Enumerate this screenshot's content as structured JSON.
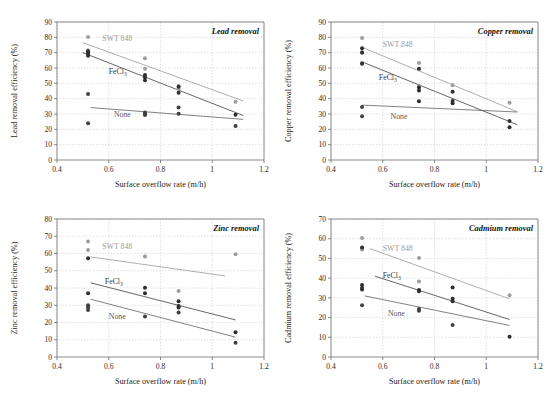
{
  "figure": {
    "shared": {
      "xlabel": "Surface overflow rate (m/h)",
      "xticks": [
        "0.4",
        "0.6",
        "0.8",
        "1",
        "1.2"
      ],
      "xlim": [
        0.4,
        1.2
      ],
      "series_labels": {
        "swt": "SWT 848",
        "fecl3_text": "FeCl",
        "fecl3_sub": "3",
        "none": "None"
      },
      "colors": {
        "swt": "#9d9d9d",
        "fecl3": "#2e2e2e",
        "none": "#3f3f3f",
        "grid": "#c9c9c9",
        "axis": "#6e6e6e"
      }
    },
    "panels": [
      {
        "id": "lead",
        "title": "Lead removal",
        "ylabel": "Lead  removal efficiency (%)",
        "ylim": [
          0,
          90
        ],
        "yticks": [
          "0",
          "10",
          "20",
          "30",
          "40",
          "50",
          "60",
          "70",
          "80",
          "90"
        ],
        "chart_data": {
          "type": "scatter",
          "title": "Lead removal",
          "xlabel": "Surface overflow rate (m/h)",
          "ylabel": "Lead  removal efficiency (%)",
          "xlim": [
            0.4,
            1.2
          ],
          "ylim": [
            0,
            90
          ],
          "grid": true,
          "legend": "inline-labels",
          "series": [
            {
              "name": "SWT 848",
              "color": "#9d9d9d",
              "points": [
                {
                  "x": 0.52,
                  "y": 80.2
                },
                {
                  "x": 0.52,
                  "y": 71.5
                },
                {
                  "x": 0.52,
                  "y": 70.0
                },
                {
                  "x": 0.74,
                  "y": 66.3
                },
                {
                  "x": 0.74,
                  "y": 59.5
                },
                {
                  "x": 0.87,
                  "y": 48.2
                },
                {
                  "x": 0.87,
                  "y": 46.5
                },
                {
                  "x": 1.09,
                  "y": 38.0
                }
              ],
              "fit": [
                {
                  "x": 0.5,
                  "y": 76.5
                },
                {
                  "x": 1.12,
                  "y": 38.5
                }
              ]
            },
            {
              "name": "FeCl3",
              "color": "#2e2e2e",
              "points": [
                {
                  "x": 0.52,
                  "y": 71.0
                },
                {
                  "x": 0.52,
                  "y": 69.5
                },
                {
                  "x": 0.52,
                  "y": 68.0
                },
                {
                  "x": 0.74,
                  "y": 55.5
                },
                {
                  "x": 0.74,
                  "y": 54.0
                },
                {
                  "x": 0.74,
                  "y": 52.0
                },
                {
                  "x": 0.87,
                  "y": 47.8
                },
                {
                  "x": 0.87,
                  "y": 43.8
                },
                {
                  "x": 1.09,
                  "y": 29.5
                }
              ],
              "fit": [
                {
                  "x": 0.5,
                  "y": 70.0
                },
                {
                  "x": 1.12,
                  "y": 29.0
                }
              ]
            },
            {
              "name": "None",
              "color": "#3f3f3f",
              "points": [
                {
                  "x": 0.52,
                  "y": 43.0
                },
                {
                  "x": 0.52,
                  "y": 24.0
                },
                {
                  "x": 0.74,
                  "y": 31.0
                },
                {
                  "x": 0.74,
                  "y": 30.0
                },
                {
                  "x": 0.74,
                  "y": 29.3
                },
                {
                  "x": 0.87,
                  "y": 34.2
                },
                {
                  "x": 0.87,
                  "y": 30.2
                },
                {
                  "x": 1.09,
                  "y": 22.2
                }
              ],
              "fit": [
                {
                  "x": 0.53,
                  "y": 34.2
                },
                {
                  "x": 1.12,
                  "y": 26.5
                }
              ]
            }
          ]
        }
      },
      {
        "id": "copper",
        "title": "Copper removal",
        "ylabel": "Copper removal efficiency (%)",
        "ylim": [
          0,
          90
        ],
        "yticks": [
          "0",
          "10",
          "20",
          "30",
          "40",
          "50",
          "60",
          "70",
          "80",
          "90"
        ],
        "chart_data": {
          "type": "scatter",
          "title": "Copper removal",
          "xlabel": "Surface overflow rate (m/h)",
          "ylabel": "Copper removal efficiency (%)",
          "xlim": [
            0.4,
            1.2
          ],
          "ylim": [
            0,
            90
          ],
          "grid": true,
          "legend": "inline-labels",
          "series": [
            {
              "name": "SWT 848",
              "color": "#9d9d9d",
              "points": [
                {
                  "x": 0.52,
                  "y": 79.5
                },
                {
                  "x": 0.52,
                  "y": 70.5
                },
                {
                  "x": 0.52,
                  "y": 63.5
                },
                {
                  "x": 0.74,
                  "y": 63.3
                },
                {
                  "x": 0.74,
                  "y": 48.5
                },
                {
                  "x": 0.87,
                  "y": 48.8
                },
                {
                  "x": 1.09,
                  "y": 37.3
                }
              ],
              "fit": [
                {
                  "x": 0.52,
                  "y": 73.5
                },
                {
                  "x": 1.12,
                  "y": 31.5
                }
              ]
            },
            {
              "name": "FeCl3",
              "color": "#2e2e2e",
              "points": [
                {
                  "x": 0.52,
                  "y": 72.8
                },
                {
                  "x": 0.52,
                  "y": 70.0
                },
                {
                  "x": 0.52,
                  "y": 62.8
                },
                {
                  "x": 0.74,
                  "y": 59.5
                },
                {
                  "x": 0.74,
                  "y": 47.3
                },
                {
                  "x": 0.74,
                  "y": 45.3
                },
                {
                  "x": 0.74,
                  "y": 38.3
                },
                {
                  "x": 0.87,
                  "y": 44.5
                },
                {
                  "x": 0.87,
                  "y": 38.5
                },
                {
                  "x": 0.87,
                  "y": 37.0
                },
                {
                  "x": 1.09,
                  "y": 25.5
                },
                {
                  "x": 1.09,
                  "y": 21.3
                }
              ],
              "fit": [
                {
                  "x": 0.52,
                  "y": 64.0
                },
                {
                  "x": 1.12,
                  "y": 23.0
                }
              ]
            },
            {
              "name": "None",
              "color": "#3f3f3f",
              "points": [
                {
                  "x": 0.52,
                  "y": 34.5
                },
                {
                  "x": 0.52,
                  "y": 28.5
                }
              ],
              "fit": [
                {
                  "x": 0.52,
                  "y": 35.8
                },
                {
                  "x": 1.12,
                  "y": 31.3
                }
              ]
            }
          ]
        }
      },
      {
        "id": "zinc",
        "title": "Zinc removal",
        "ylabel": "Zinc removal efficiency (%)",
        "ylim": [
          0,
          80
        ],
        "yticks": [
          "0",
          "10",
          "20",
          "30",
          "40",
          "50",
          "60",
          "70",
          "80"
        ],
        "chart_data": {
          "type": "scatter",
          "title": "Zinc removal",
          "xlabel": "Surface overflow rate (m/h)",
          "ylabel": "Zinc removal efficiency (%)",
          "xlim": [
            0.4,
            1.2
          ],
          "ylim": [
            0,
            80
          ],
          "grid": true,
          "legend": "inline-labels",
          "series": [
            {
              "name": "SWT 848",
              "color": "#9d9d9d",
              "points": [
                {
                  "x": 0.52,
                  "y": 67.0
                },
                {
                  "x": 0.52,
                  "y": 62.0
                },
                {
                  "x": 0.74,
                  "y": 58.2
                },
                {
                  "x": 0.87,
                  "y": 38.3
                },
                {
                  "x": 1.09,
                  "y": 59.5
                }
              ],
              "fit": [
                {
                  "x": 0.53,
                  "y": 58.0
                },
                {
                  "x": 1.05,
                  "y": 47.0
                }
              ]
            },
            {
              "name": "FeCl3",
              "color": "#2e2e2e",
              "points": [
                {
                  "x": 0.52,
                  "y": 57.3
                },
                {
                  "x": 0.52,
                  "y": 37.0
                },
                {
                  "x": 0.74,
                  "y": 40.2
                },
                {
                  "x": 0.74,
                  "y": 37.0
                },
                {
                  "x": 0.87,
                  "y": 32.3
                },
                {
                  "x": 0.87,
                  "y": 29.5
                },
                {
                  "x": 0.87,
                  "y": 28.7
                },
                {
                  "x": 1.09,
                  "y": 14.3
                }
              ],
              "fit": [
                {
                  "x": 0.53,
                  "y": 43.0
                },
                {
                  "x": 1.09,
                  "y": 21.5
                }
              ]
            },
            {
              "name": "None",
              "color": "#3f3f3f",
              "points": [
                {
                  "x": 0.52,
                  "y": 30.0
                },
                {
                  "x": 0.52,
                  "y": 28.8
                },
                {
                  "x": 0.52,
                  "y": 27.3
                },
                {
                  "x": 0.74,
                  "y": 23.5
                },
                {
                  "x": 0.87,
                  "y": 25.8
                },
                {
                  "x": 1.09,
                  "y": 8.2
                }
              ],
              "fit": [
                {
                  "x": 0.53,
                  "y": 33.5
                },
                {
                  "x": 1.09,
                  "y": 11.5
                }
              ]
            }
          ]
        }
      },
      {
        "id": "cadmium",
        "title": "Cadmium removal",
        "ylabel": "Cadmium removal efficiency (%)",
        "ylim": [
          0,
          70
        ],
        "yticks": [
          "0",
          "10",
          "20",
          "30",
          "40",
          "50",
          "60",
          "70"
        ],
        "chart_data": {
          "type": "scatter",
          "title": "Cadmium removal",
          "xlabel": "Surface overflow rate (m/h)",
          "ylabel": "Cadmium removal efficiency (%)",
          "xlim": [
            0.4,
            1.2
          ],
          "ylim": [
            0,
            70
          ],
          "grid": true,
          "legend": "inline-labels",
          "series": [
            {
              "name": "SWT 848",
              "color": "#9d9d9d",
              "points": [
                {
                  "x": 0.52,
                  "y": 60.3
                },
                {
                  "x": 0.52,
                  "y": 54.5
                },
                {
                  "x": 0.74,
                  "y": 50.2
                },
                {
                  "x": 0.74,
                  "y": 38.3
                },
                {
                  "x": 1.09,
                  "y": 31.3
                }
              ],
              "fit": [
                {
                  "x": 0.55,
                  "y": 55.0
                },
                {
                  "x": 1.09,
                  "y": 29.5
                }
              ]
            },
            {
              "name": "FeCl3",
              "color": "#2e2e2e",
              "points": [
                {
                  "x": 0.52,
                  "y": 55.5
                },
                {
                  "x": 0.52,
                  "y": 36.5
                },
                {
                  "x": 0.52,
                  "y": 35.0
                },
                {
                  "x": 0.52,
                  "y": 34.3
                },
                {
                  "x": 0.74,
                  "y": 34.0
                },
                {
                  "x": 0.74,
                  "y": 33.3
                },
                {
                  "x": 0.87,
                  "y": 35.3
                },
                {
                  "x": 0.87,
                  "y": 29.5
                },
                {
                  "x": 0.87,
                  "y": 28.3
                },
                {
                  "x": 1.09,
                  "y": 10.3
                }
              ],
              "fit": [
                {
                  "x": 0.57,
                  "y": 41.0
                },
                {
                  "x": 1.09,
                  "y": 19.0
                }
              ]
            },
            {
              "name": "None",
              "color": "#3f3f3f",
              "points": [
                {
                  "x": 0.52,
                  "y": 26.3
                },
                {
                  "x": 0.74,
                  "y": 24.3
                },
                {
                  "x": 0.74,
                  "y": 23.5
                },
                {
                  "x": 0.87,
                  "y": 16.2
                }
              ],
              "fit": [
                {
                  "x": 0.53,
                  "y": 31.0
                },
                {
                  "x": 1.09,
                  "y": 16.0
                }
              ]
            }
          ]
        }
      }
    ]
  }
}
